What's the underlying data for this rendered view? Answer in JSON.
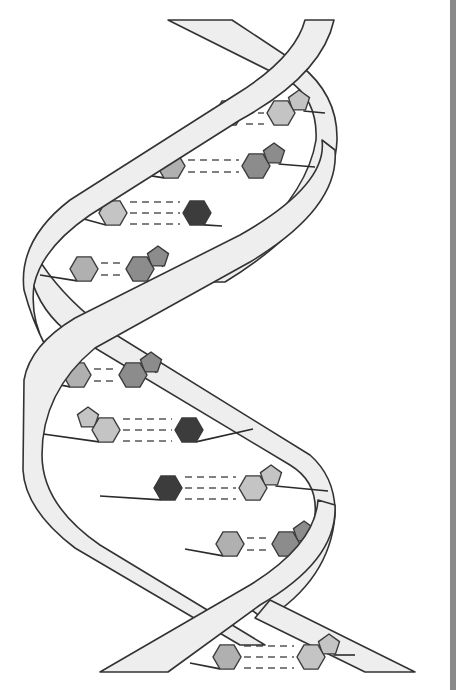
{
  "figure": {
    "colors": {
      "background": "#ffffff",
      "ribbon_fill": "#eeeeee",
      "ribbon_stroke": "#333333",
      "hydrogen_bond": "#808080",
      "base_light": "#c4c4c4",
      "base_medium_light": "#b0b0b0",
      "base_medium": "#8c8c8c",
      "base_dark": "#3c3c3c",
      "frame_bar": "#8a8a8a"
    },
    "base_pairs": [
      {
        "y": 113,
        "left_x": 229,
        "left_shade": "medium_light",
        "left_pentagon": false,
        "right_x": 281,
        "right_shade": "light",
        "right_pentagon": true,
        "bonds": 3,
        "stub_left": [
          205,
          122
        ],
        "stub_right": [
          325,
          113
        ]
      },
      {
        "y": 166,
        "left_x": 171,
        "left_shade": "medium_light",
        "left_pentagon": false,
        "right_x": 256,
        "right_shade": "medium",
        "right_pentagon": true,
        "bonds": 2,
        "stub_left": [
          120,
          171
        ],
        "stub_right": [
          315,
          167
        ]
      },
      {
        "y": 213,
        "left_x": 113,
        "left_shade": "light",
        "left_pentagon": true,
        "right_x": 197,
        "right_shade": "dark",
        "right_pentagon": false,
        "bonds": 3,
        "stub_left": [
          58,
          212
        ],
        "stub_right": [
          222,
          226
        ]
      },
      {
        "y": 269,
        "left_x": 84,
        "left_shade": "medium_light",
        "left_pentagon": false,
        "right_x": 140,
        "right_shade": "medium",
        "right_pentagon": true,
        "bonds": 2,
        "stub_left": [
          40,
          275
        ],
        "stub_right": [
          165,
          256
        ]
      },
      {
        "y": 375,
        "left_x": 77,
        "left_shade": "medium_light",
        "left_pentagon": false,
        "right_x": 133,
        "right_shade": "medium",
        "right_pentagon": true,
        "bonds": 2,
        "stub_left": [
          45,
          382
        ],
        "stub_right": [
          160,
          364
        ]
      },
      {
        "y": 430,
        "left_x": 106,
        "left_shade": "light",
        "left_pentagon": true,
        "right_x": 189,
        "right_shade": "dark",
        "right_pentagon": false,
        "bonds": 3,
        "stub_left": [
          36,
          433
        ],
        "stub_right": [
          253,
          429
        ]
      },
      {
        "y": 488,
        "left_x": 168,
        "left_shade": "dark",
        "left_pentagon": false,
        "right_x": 253,
        "right_shade": "light",
        "right_pentagon": true,
        "bonds": 3,
        "stub_left": [
          100,
          496
        ],
        "stub_right": [
          328,
          491
        ]
      },
      {
        "y": 544,
        "left_x": 230,
        "left_shade": "medium_light",
        "left_pentagon": false,
        "right_x": 286,
        "right_shade": "medium",
        "right_pentagon": true,
        "bonds": 2,
        "stub_left": [
          185,
          549
        ],
        "stub_right": [
          316,
          530
        ]
      },
      {
        "y": 657,
        "left_x": 227,
        "left_shade": "medium_light",
        "left_pentagon": false,
        "right_x": 311,
        "right_shade": "light",
        "right_pentagon": true,
        "bonds": 3,
        "stub_left": [
          190,
          663
        ],
        "stub_right": [
          355,
          655
        ]
      }
    ]
  }
}
